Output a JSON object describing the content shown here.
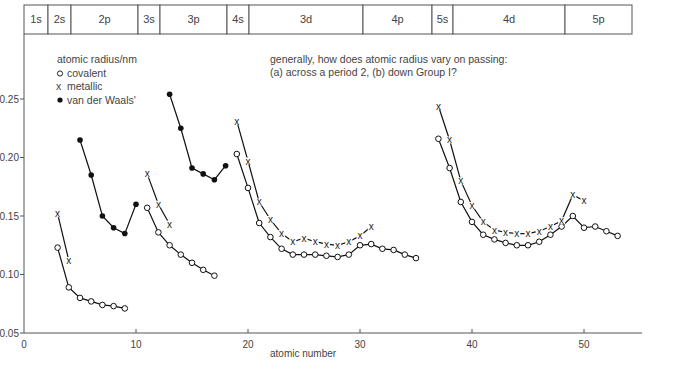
{
  "header": {
    "cells": [
      {
        "label": "1s",
        "x0": 24,
        "x1": 48
      },
      {
        "label": "2s",
        "x0": 48,
        "x1": 71
      },
      {
        "label": "2p",
        "x0": 71,
        "x1": 138
      },
      {
        "label": "3s",
        "x0": 138,
        "x1": 160
      },
      {
        "label": "3p",
        "x0": 160,
        "x1": 227
      },
      {
        "label": "4s",
        "x0": 227,
        "x1": 249
      },
      {
        "label": "3d",
        "x0": 249,
        "x1": 363
      },
      {
        "label": "4p",
        "x0": 363,
        "x1": 432
      },
      {
        "label": "5s",
        "x0": 432,
        "x1": 453
      },
      {
        "label": "4d",
        "x0": 453,
        "x1": 565
      },
      {
        "label": "5p",
        "x0": 565,
        "x1": 632
      }
    ]
  },
  "legend": {
    "title": "atomic radius/nm",
    "items": [
      {
        "marker": "open-circle",
        "label": "covalent"
      },
      {
        "marker": "x",
        "label": "metallic"
      },
      {
        "marker": "filled-circle",
        "label": "van der Waals'"
      }
    ]
  },
  "question": {
    "line1": "generally, how does atomic radius vary on passing:",
    "line2": "(a) across a period 2, (b) down Group I?"
  },
  "chart_data": {
    "type": "line",
    "title": "",
    "xlabel": "atomic number",
    "ylabel": "atomic radius/nm",
    "xlim": [
      0,
      55
    ],
    "ylim": [
      0.05,
      0.27
    ],
    "xticks": [
      0,
      10,
      20,
      30,
      40,
      50
    ],
    "yticks": [
      0.05,
      0.1,
      0.15,
      0.2,
      0.25
    ],
    "ytick_labels": [
      "0.05",
      "0.10",
      "0.15",
      "0.20",
      "0.25"
    ],
    "grid": false,
    "legend_position": "upper-left",
    "series": [
      {
        "name": "covalent",
        "marker": "open-circle",
        "segments": [
          {
            "x": [
              3,
              4,
              5,
              6,
              7,
              8,
              9
            ],
            "y": [
              0.123,
              0.089,
              0.08,
              0.077,
              0.074,
              0.073,
              0.071
            ]
          },
          {
            "x": [
              11,
              12,
              13,
              14,
              15,
              16,
              17
            ],
            "y": [
              0.157,
              0.136,
              0.125,
              0.117,
              0.11,
              0.104,
              0.099
            ]
          },
          {
            "x": [
              19,
              20,
              21,
              22,
              23,
              24,
              25,
              26,
              27,
              28,
              29,
              30,
              31,
              32,
              33,
              34,
              35
            ],
            "y": [
              0.203,
              0.174,
              0.144,
              0.132,
              0.122,
              0.117,
              0.117,
              0.117,
              0.116,
              0.115,
              0.117,
              0.125,
              0.126,
              0.122,
              0.121,
              0.117,
              0.114
            ]
          },
          {
            "x": [
              37,
              38,
              39,
              40,
              41,
              42,
              43,
              44,
              45,
              46,
              47,
              48,
              49,
              50,
              51,
              52,
              53
            ],
            "y": [
              0.216,
              0.191,
              0.162,
              0.145,
              0.134,
              0.13,
              0.127,
              0.125,
              0.125,
              0.128,
              0.134,
              0.141,
              0.15,
              0.14,
              0.141,
              0.137,
              0.133
            ]
          }
        ]
      },
      {
        "name": "metallic",
        "marker": "x",
        "segments": [
          {
            "x": [
              3,
              4
            ],
            "y": [
              0.152,
              0.112
            ]
          },
          {
            "x": [
              11,
              12,
              13
            ],
            "y": [
              0.186,
              0.16,
              0.143
            ]
          },
          {
            "x": [
              19,
              20,
              21,
              22,
              23,
              24,
              25,
              26,
              27,
              28,
              29,
              30,
              31
            ],
            "y": [
              0.231,
              0.197,
              0.162,
              0.147,
              0.135,
              0.128,
              0.131,
              0.128,
              0.126,
              0.125,
              0.128,
              0.133,
              0.141
            ]
          },
          {
            "x": [
              37,
              38,
              39,
              40,
              41,
              42,
              43,
              44,
              45,
              46,
              47,
              48,
              49,
              50
            ],
            "y": [
              0.244,
              0.215,
              0.18,
              0.159,
              0.145,
              0.138,
              0.136,
              0.135,
              0.135,
              0.137,
              0.141,
              0.146,
              0.168,
              0.163
            ]
          }
        ]
      },
      {
        "name": "van der Waals'",
        "marker": "filled-circle",
        "segments": [
          {
            "x": [
              5,
              6,
              7,
              8,
              9,
              10
            ],
            "y": [
              0.215,
              0.185,
              0.15,
              0.14,
              0.135,
              0.16
            ]
          },
          {
            "x": [
              13,
              14,
              15,
              16,
              17,
              18
            ],
            "y": [
              0.254,
              0.225,
              0.191,
              0.186,
              0.181,
              0.193
            ]
          }
        ]
      }
    ]
  }
}
